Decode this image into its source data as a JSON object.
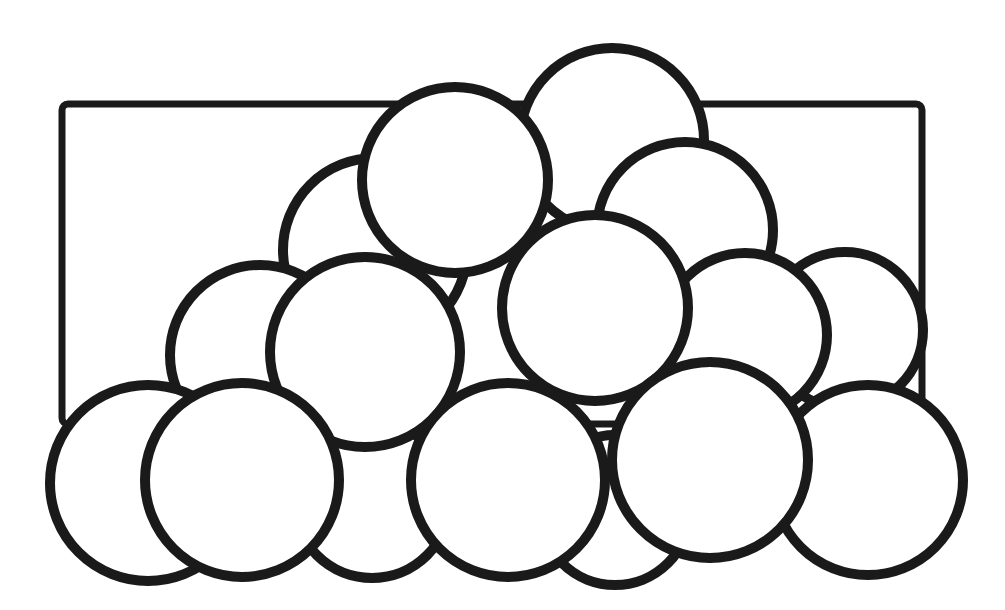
{
  "diagram": {
    "title": "",
    "width": 1005,
    "height": 610,
    "stroke_color": "#1a1a1a",
    "fill_color": "#ffffff",
    "background": "#ffffff",
    "rectangle": {
      "x": 62,
      "y": 104,
      "width": 860,
      "height": 320,
      "rx": 6
    },
    "circles": [
      {
        "id": "c-back-top-right",
        "cx": 612,
        "cy": 140,
        "r": 92
      },
      {
        "id": "c-back-upper-left",
        "cx": 375,
        "cy": 250,
        "r": 92
      },
      {
        "id": "c-back-upper-right",
        "cx": 685,
        "cy": 230,
        "r": 88
      },
      {
        "id": "c-top-center",
        "cx": 455,
        "cy": 180,
        "r": 93
      },
      {
        "id": "c-back-bottom-center",
        "cx": 372,
        "cy": 500,
        "r": 78
      },
      {
        "id": "c-back-bottom-right",
        "cx": 615,
        "cy": 510,
        "r": 75
      },
      {
        "id": "c-mid-left",
        "cx": 260,
        "cy": 355,
        "r": 90
      },
      {
        "id": "c-mid-far-right",
        "cx": 845,
        "cy": 330,
        "r": 78
      },
      {
        "id": "c-mid-right",
        "cx": 745,
        "cy": 335,
        "r": 82
      },
      {
        "id": "c-mid-center-left",
        "cx": 365,
        "cy": 352,
        "r": 95
      },
      {
        "id": "c-mid-center",
        "cx": 595,
        "cy": 308,
        "r": 93
      },
      {
        "id": "c-bottom-far-left",
        "cx": 148,
        "cy": 483,
        "r": 98
      },
      {
        "id": "c-bottom-left",
        "cx": 242,
        "cy": 480,
        "r": 97
      },
      {
        "id": "c-bottom-center",
        "cx": 508,
        "cy": 480,
        "r": 97
      },
      {
        "id": "c-bottom-far-right",
        "cx": 868,
        "cy": 480,
        "r": 95
      },
      {
        "id": "c-bottom-right",
        "cx": 710,
        "cy": 460,
        "r": 98
      }
    ]
  }
}
